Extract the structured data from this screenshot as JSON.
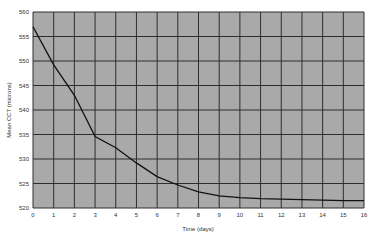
{
  "colors": {
    "plot_bg": "#a9a9a9",
    "grid": "#2e2e2e",
    "line": "#111111",
    "text": "#333333",
    "page_bg": "#ffffff"
  },
  "chart_data": {
    "type": "line",
    "title": "",
    "xlabel": "Time (days)",
    "ylabel": "Mean CCT (microns)",
    "xlim": [
      0,
      16
    ],
    "ylim": [
      520,
      560
    ],
    "xticks": [
      0,
      1,
      2,
      3,
      4,
      5,
      6,
      7,
      8,
      9,
      10,
      11,
      12,
      13,
      14,
      15,
      16
    ],
    "yticks": [
      520,
      525,
      530,
      535,
      540,
      545,
      550,
      555,
      560
    ],
    "grid": true,
    "legend": null,
    "series": [
      {
        "name": "Mean CCT",
        "x": [
          0,
          1,
          2,
          3,
          4,
          5,
          6,
          7,
          8,
          9,
          10,
          11,
          12,
          13,
          14,
          15,
          16
        ],
        "values": [
          557,
          549.2,
          543,
          534.6,
          532.3,
          529.2,
          526.4,
          524.7,
          523.3,
          522.5,
          522.1,
          521.9,
          521.8,
          521.7,
          521.6,
          521.5,
          521.5
        ]
      }
    ]
  }
}
